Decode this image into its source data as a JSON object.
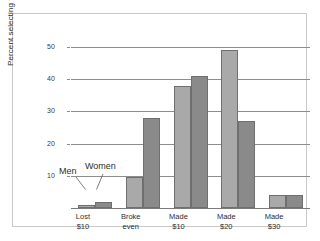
{
  "chart_data": {
    "type": "bar",
    "title": "",
    "subtitle": "",
    "xlabel": "",
    "ylabel": "Percent selecting the solution",
    "ylim": [
      0,
      50
    ],
    "yticks": [
      10,
      20,
      30,
      40,
      50
    ],
    "ytick_labels": [
      "10",
      "20",
      "30",
      "40",
      "50"
    ],
    "grid": true,
    "legend_position": "inline-annotation",
    "categories": [
      "Lost $10",
      "Broke even",
      "Made $10",
      "Made $20",
      "Made $30"
    ],
    "category_lines": [
      [
        "Lost",
        "$10"
      ],
      [
        "Broke",
        "even"
      ],
      [
        "Made",
        "$10"
      ],
      [
        "Made",
        "$20"
      ],
      [
        "Made",
        "$30"
      ]
    ],
    "series": [
      {
        "name": "Men",
        "color": "#a9a9a9",
        "values": [
          1,
          9.5,
          38,
          49,
          4
        ]
      },
      {
        "name": "Women",
        "color": "#8a8a8a",
        "values": [
          2,
          28,
          41,
          27,
          4
        ]
      }
    ],
    "annotations": [
      {
        "text": "Men",
        "points_to": "Lost $10 / Men bar"
      },
      {
        "text": "Women",
        "points_to": "Lost $10 / Women bar"
      }
    ]
  },
  "axis": {
    "y_title": "Percent selecting the solution",
    "tick_10": "10",
    "tick_20": "20",
    "tick_30": "30",
    "tick_40": "40",
    "tick_50": "50"
  },
  "categories": {
    "c0_l1": "Lost",
    "c0_l2": "$10",
    "c1_l1": "Broke",
    "c1_l2": "even",
    "c2_l1": "Made",
    "c2_l2": "$10",
    "c3_l1": "Made",
    "c3_l2": "$20",
    "c4_l1": "Made",
    "c4_l2": "$30"
  },
  "annotations": {
    "men": "Men",
    "women": "Women"
  }
}
